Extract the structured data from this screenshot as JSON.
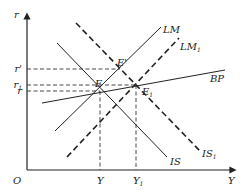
{
  "axes": {
    "y_label": "r",
    "x_label": "Y",
    "origin_label": "O"
  },
  "y_ticks": [
    {
      "label": "r'",
      "y": 69
    },
    {
      "label": "r",
      "sub": "1",
      "y": 85
    },
    {
      "label": "r",
      "y": 91
    }
  ],
  "x_ticks": [
    {
      "label": "Y",
      "x": 100
    },
    {
      "label": "Y",
      "sub": "1",
      "x": 136
    }
  ],
  "curves": [
    {
      "name": "LM",
      "label": "LM",
      "style": "solid",
      "x1": 55,
      "y1": 131,
      "x2": 161,
      "y2": 27,
      "label_x": 163,
      "label_y": 33
    },
    {
      "name": "LM1",
      "label": "LM",
      "sub": "1",
      "style": "dashed",
      "x1": 67,
      "y1": 157,
      "x2": 179,
      "y2": 38,
      "label_x": 180,
      "label_y": 50
    },
    {
      "name": "IS",
      "label": "IS",
      "style": "solid",
      "x1": 57,
      "y1": 43,
      "x2": 167,
      "y2": 157,
      "label_x": 170,
      "label_y": 165
    },
    {
      "name": "IS1",
      "label": "IS",
      "sub": "1",
      "style": "dashed",
      "x1": 76,
      "y1": 23,
      "x2": 200,
      "y2": 151,
      "label_x": 202,
      "label_y": 157
    },
    {
      "name": "BP",
      "label": "BP",
      "style": "solid",
      "x1": 42,
      "y1": 103,
      "x2": 225,
      "y2": 70,
      "label_x": 210,
      "label_y": 82
    }
  ],
  "points": [
    {
      "name": "E",
      "label": "E",
      "x": 100,
      "y": 91,
      "label_x": 95,
      "label_y": 87
    },
    {
      "name": "E-prime",
      "label": "E'",
      "x": 120,
      "y": 68,
      "label_x": 117,
      "label_y": 66
    },
    {
      "name": "E1",
      "label": "E",
      "sub": "1",
      "x": 135,
      "y": 85,
      "label_x": 142,
      "label_y": 95
    }
  ]
}
